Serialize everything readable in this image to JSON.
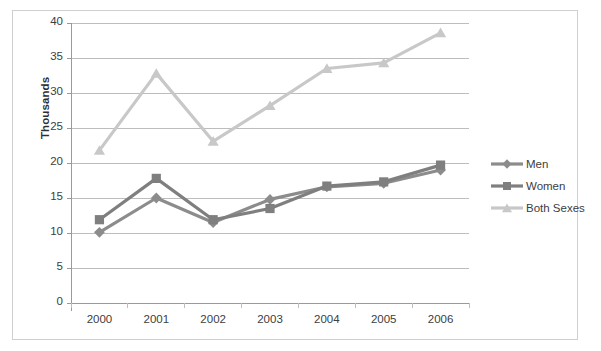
{
  "chart_data": {
    "type": "line",
    "title": "",
    "xlabel": "",
    "ylabel": "Thousands",
    "categories": [
      "2000",
      "2001",
      "2002",
      "2003",
      "2004",
      "2005",
      "2006"
    ],
    "ylim": [
      0,
      40
    ],
    "ytick_step": 5,
    "yticks": [
      "0",
      "5",
      "10",
      "15",
      "20",
      "25",
      "30",
      "35",
      "40"
    ],
    "grid": true,
    "legend_position": "right",
    "series": [
      {
        "name": "Men",
        "marker": "diamond",
        "color": "#8c8c8c",
        "values": [
          10.1,
          15.0,
          11.5,
          14.8,
          16.6,
          17.1,
          19.0
        ]
      },
      {
        "name": "Women",
        "marker": "square",
        "color": "#7f7f7f",
        "values": [
          11.9,
          17.8,
          11.9,
          13.5,
          16.7,
          17.3,
          19.7
        ]
      },
      {
        "name": "Both Sexes",
        "marker": "triangle",
        "color": "#c8c8c8",
        "values": [
          21.8,
          32.8,
          23.1,
          28.2,
          33.5,
          34.3,
          38.6
        ]
      }
    ]
  },
  "legend": {
    "items": [
      {
        "label": "Men"
      },
      {
        "label": "Women"
      },
      {
        "label": "Both Sexes"
      }
    ]
  },
  "axis": {
    "y_title": "Thousands"
  }
}
